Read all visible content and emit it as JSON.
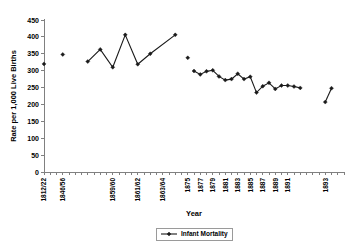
{
  "chart_data": {
    "type": "line",
    "title": "",
    "xlabel": "Year",
    "ylabel": "Rate per 1,000 Live Births",
    "ylim": [
      0,
      450
    ],
    "ytick_step": 50,
    "yticks": [
      "0",
      "50",
      "100",
      "150",
      "200",
      "250",
      "300",
      "350",
      "400",
      "450"
    ],
    "grid": false,
    "legend_position": "bottom",
    "legend": [
      "Infant Mortality"
    ],
    "categories": [
      "1812/22",
      "1846/56",
      "",
      "1859/60",
      "1861/62",
      "1863/64",
      "",
      "1875",
      "1877",
      "1879",
      "1881",
      "1883",
      "1885",
      "1887",
      "1889",
      "1891",
      "1893",
      "",
      "1897"
    ],
    "xtick_labels_rotated": true,
    "series": [
      {
        "name": "Infant Mortality",
        "points": [
          {
            "x": "1812/22",
            "y": 320
          },
          {
            "x": "1846/56",
            "y": 348
          },
          {
            "x": "1858",
            "y": 327
          },
          {
            "x": "1859/60",
            "y": 363
          },
          {
            "x": "1860",
            "y": 310
          },
          {
            "x": "1861/62",
            "y": 406
          },
          {
            "x": "1862",
            "y": 319
          },
          {
            "x": "1863/64",
            "y": 350
          },
          {
            "x": "1865",
            "y": 406
          },
          {
            "x": "1875",
            "y": 338
          },
          {
            "x": "1877",
            "y": 299
          },
          {
            "x": "1878",
            "y": 289
          },
          {
            "x": "1879",
            "y": 298
          },
          {
            "x": "1880",
            "y": 301
          },
          {
            "x": "1881",
            "y": 283
          },
          {
            "x": "1882",
            "y": 272
          },
          {
            "x": "1883",
            "y": 275
          },
          {
            "x": "1884",
            "y": 291
          },
          {
            "x": "1885",
            "y": 275
          },
          {
            "x": "1886",
            "y": 282
          },
          {
            "x": "1887",
            "y": 235
          },
          {
            "x": "1888",
            "y": 254
          },
          {
            "x": "1889",
            "y": 264
          },
          {
            "x": "1890",
            "y": 246
          },
          {
            "x": "1891",
            "y": 256
          },
          {
            "x": "1892",
            "y": 256
          },
          {
            "x": "1893",
            "y": 253
          },
          {
            "x": "1894",
            "y": 249
          },
          {
            "x": "1896",
            "y": 207
          },
          {
            "x": "1897",
            "y": 248
          }
        ],
        "segments": [
          [
            {
              "i": 0
            }
          ],
          [
            {
              "i": 1
            }
          ],
          [
            {
              "i": 2
            },
            {
              "i": 3
            },
            {
              "i": 4
            },
            {
              "i": 5
            },
            {
              "i": 6
            },
            {
              "i": 7
            },
            {
              "i": 8
            }
          ],
          [
            {
              "i": 9
            }
          ],
          [
            {
              "i": 10
            },
            {
              "i": 11
            },
            {
              "i": 12
            },
            {
              "i": 13
            },
            {
              "i": 14
            },
            {
              "i": 15
            },
            {
              "i": 16
            },
            {
              "i": 17
            },
            {
              "i": 18
            },
            {
              "i": 19
            },
            {
              "i": 20
            },
            {
              "i": 21
            },
            {
              "i": 22
            },
            {
              "i": 23
            },
            {
              "i": 24
            },
            {
              "i": 25
            },
            {
              "i": 26
            },
            {
              "i": 27
            }
          ],
          [
            {
              "i": 28
            },
            {
              "i": 29
            }
          ]
        ]
      }
    ]
  },
  "geometry": {
    "plot_left": 44,
    "plot_right": 344,
    "plot_top": 20,
    "plot_bottom": 172,
    "category_count": 38,
    "point_slots": [
      0,
      3,
      7,
      9,
      11,
      13,
      15,
      17,
      21,
      23,
      24,
      25,
      26,
      27,
      28,
      29,
      30,
      31,
      32,
      33,
      34,
      35,
      36,
      37,
      38,
      39,
      40,
      41,
      45,
      46
    ],
    "label_slots": [
      0,
      3,
      11,
      15,
      19,
      23,
      25,
      27,
      29,
      31,
      33,
      35,
      37,
      39,
      45
    ],
    "slot_total": 48
  }
}
